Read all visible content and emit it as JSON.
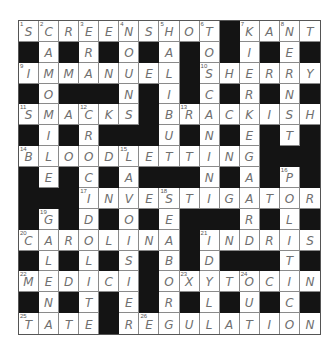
{
  "puzzle": {
    "size": 15,
    "rows": [
      "SCREENSHOT#KANT",
      "#A#R#O#A#O#I#E#",
      "IMMANUEL#SHERRY",
      "#O###N#I#C#R#N#",
      "SMACKS#BRACKISH",
      "#I#R###U#N#E#T#",
      "BLOODLETTING###",
      "#E#C#A###N#A#P#",
      "###INVESTIGATOR",
      "#G#D#O#E###R#L#",
      "CAROLINA#INDRIS",
      "#L#L#S#B#D###T#",
      "MEDICI#OXYTOCIN",
      "#N#T#E#R#L#U#C#",
      "TATE#REGULATION"
    ],
    "numbers": [
      {
        "r": 0,
        "c": 0,
        "n": "1"
      },
      {
        "r": 0,
        "c": 1,
        "n": "2"
      },
      {
        "r": 0,
        "c": 3,
        "n": "3"
      },
      {
        "r": 0,
        "c": 5,
        "n": "4"
      },
      {
        "r": 0,
        "c": 7,
        "n": "5"
      },
      {
        "r": 0,
        "c": 9,
        "n": "6"
      },
      {
        "r": 0,
        "c": 11,
        "n": "7"
      },
      {
        "r": 0,
        "c": 13,
        "n": "8"
      },
      {
        "r": 2,
        "c": 0,
        "n": "9"
      },
      {
        "r": 2,
        "c": 9,
        "n": "10"
      },
      {
        "r": 4,
        "c": 0,
        "n": "11"
      },
      {
        "r": 4,
        "c": 3,
        "n": "12"
      },
      {
        "r": 4,
        "c": 8,
        "n": "13"
      },
      {
        "r": 6,
        "c": 0,
        "n": "14"
      },
      {
        "r": 6,
        "c": 5,
        "n": "15"
      },
      {
        "r": 7,
        "c": 13,
        "n": "16"
      },
      {
        "r": 8,
        "c": 3,
        "n": "17"
      },
      {
        "r": 8,
        "c": 7,
        "n": "18"
      },
      {
        "r": 9,
        "c": 1,
        "n": "19"
      },
      {
        "r": 10,
        "c": 0,
        "n": "20"
      },
      {
        "r": 10,
        "c": 9,
        "n": "21"
      },
      {
        "r": 12,
        "c": 0,
        "n": "22"
      },
      {
        "r": 12,
        "c": 8,
        "n": "23"
      },
      {
        "r": 12,
        "c": 11,
        "n": "24"
      },
      {
        "r": 14,
        "c": 0,
        "n": "25"
      },
      {
        "r": 14,
        "c": 6,
        "n": "26"
      }
    ],
    "colors": {
      "block": "#141414",
      "letter": "#6f6f6f",
      "gridline": "#8a8a8a"
    }
  }
}
